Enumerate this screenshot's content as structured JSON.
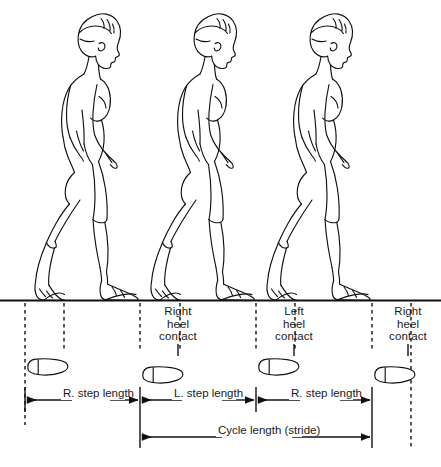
{
  "figure": {
    "type": "line-art anatomical diagram",
    "ink_color": "#111111",
    "paper_color": "#ffffff",
    "ground_line_y": 300
  },
  "event_labels": [
    {
      "id": "right-heel-contact-1",
      "lines": [
        "Right",
        "heel",
        "contact"
      ],
      "x": 178,
      "y": 305
    },
    {
      "id": "left-heel-contact",
      "lines": [
        "Left",
        "heel",
        "contact"
      ],
      "x": 294,
      "y": 305
    },
    {
      "id": "right-heel-contact-2",
      "lines": [
        "Right",
        "heel",
        "contact"
      ],
      "x": 408,
      "y": 305
    }
  ],
  "dimensions": [
    {
      "id": "r-step-length-1",
      "lines": [
        "R. step",
        "length"
      ],
      "from": 25,
      "to": 140,
      "y": 400
    },
    {
      "id": "l-step-length",
      "lines": [
        "L. step",
        "length"
      ],
      "from": 140,
      "to": 256,
      "y": 400
    },
    {
      "id": "r-step-length-2",
      "lines": [
        "R. step",
        "length"
      ],
      "from": 256,
      "to": 372,
      "y": 400
    },
    {
      "id": "cycle-length",
      "lines": [
        "Cycle length",
        "(stride)"
      ],
      "from": 140,
      "to": 372,
      "y": 437
    }
  ],
  "guide_lines": [
    {
      "id": "guide-1",
      "x": 25,
      "style": "dashed",
      "top": 303,
      "bottom": 425
    },
    {
      "id": "guide-2",
      "x": 64,
      "style": "dashed",
      "top": 303,
      "bottom": 352
    },
    {
      "id": "guide-3",
      "x": 140,
      "style": "dashed",
      "top": 303,
      "bottom": 352
    },
    {
      "id": "guide-4",
      "x": 180,
      "style": "dashed",
      "top": 303,
      "bottom": 352
    },
    {
      "id": "guide-5",
      "x": 256,
      "style": "dashed",
      "top": 303,
      "bottom": 352
    },
    {
      "id": "guide-6",
      "x": 295,
      "style": "dashed",
      "top": 303,
      "bottom": 352
    },
    {
      "id": "guide-7",
      "x": 372,
      "style": "dashed",
      "top": 303,
      "bottom": 352
    },
    {
      "id": "guide-8",
      "x": 411,
      "style": "dashed",
      "top": 303,
      "bottom": 450
    }
  ],
  "event_ticks": [
    {
      "id": "tick-right-1",
      "x": 178,
      "top": 344,
      "bottom": 356
    },
    {
      "id": "tick-left",
      "x": 294,
      "top": 344,
      "bottom": 356
    },
    {
      "id": "tick-right-2",
      "x": 408,
      "top": 344,
      "bottom": 356
    }
  ],
  "footprints": [
    {
      "id": "footprint-left-1",
      "side": "left",
      "x": 25,
      "y": 365
    },
    {
      "id": "footprint-right-1",
      "side": "right",
      "x": 140,
      "y": 369
    },
    {
      "id": "footprint-left-2",
      "side": "left",
      "x": 256,
      "y": 365
    },
    {
      "id": "footprint-right-2",
      "side": "right",
      "x": 372,
      "y": 369
    }
  ],
  "walkers": [
    {
      "id": "walker-1",
      "offset_x": 0,
      "label": "first stance figure"
    },
    {
      "id": "walker-2",
      "offset_x": 116,
      "label": "second stance figure"
    },
    {
      "id": "walker-3",
      "offset_x": 232,
      "label": "third stance figure"
    }
  ],
  "footnote": {
    "text": ""
  }
}
